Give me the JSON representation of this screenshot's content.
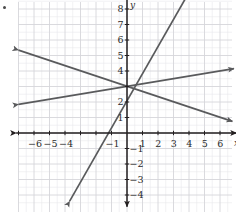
{
  "figure": {
    "marker": "•",
    "background_color": "#ffffff",
    "grid_color": "#d6d6da",
    "grid_minor_color": "#e9e9ec",
    "axis_color": "#231f20",
    "line_color": "#595a5c",
    "label_color": "#2b2b2b"
  },
  "axes": {
    "x_axis_letter": "x",
    "y_axis_letter": "y",
    "x_tick_labels": [
      "-6",
      "-5",
      "-4",
      "-1",
      "1",
      "2",
      "3",
      "4",
      "5",
      "6"
    ],
    "y_tick_labels": [
      "8",
      "7",
      "6",
      "5",
      "4",
      "2",
      "1",
      "-1",
      "-2",
      "-3",
      "-4"
    ]
  },
  "chart_data": {
    "type": "line",
    "title": "",
    "xlabel": "x",
    "ylabel": "y",
    "xlim": [
      -7.5,
      7.3
    ],
    "ylim": [
      -5.0,
      9.8
    ],
    "grid": true,
    "legend": "none",
    "x_ticks": [
      -6,
      -5,
      -4,
      -1,
      1,
      2,
      3,
      4,
      5,
      6
    ],
    "y_ticks": [
      8,
      7,
      6,
      5,
      4,
      2,
      1,
      -1,
      -2,
      -3,
      -4
    ],
    "x_ticks_all": [
      -7,
      -6,
      -5,
      -4,
      -3,
      -2,
      -1,
      0,
      1,
      2,
      3,
      4,
      5,
      6,
      7
    ],
    "y_ticks_all": [
      -4,
      -3,
      -2,
      -1,
      0,
      1,
      2,
      3,
      4,
      5,
      6,
      7,
      8,
      9
    ],
    "common_intersection": [
      0,
      3
    ],
    "series": [
      {
        "name": "steep-line",
        "slope": 2,
        "intercept": 3,
        "equation": "y = 2x + 3",
        "x_intercept": -1.5,
        "points": [
          [
            -3.7,
            -4.4
          ],
          [
            4.3,
            9.6
          ]
        ],
        "arrow_start": true,
        "arrow_end": true
      },
      {
        "name": "shallow-rising-line",
        "slope": 0.1667,
        "intercept": 3,
        "equation": "y = (1/6)x + 3",
        "x_intercept": -18,
        "points": [
          [
            -7.0,
            1.85
          ],
          [
            6.9,
            4.15
          ]
        ],
        "arrow_start": true,
        "arrow_end": true
      },
      {
        "name": "descending-line",
        "slope": -0.3333,
        "intercept": 3,
        "equation": "y = -(1/3)x + 3",
        "x_intercept": 9,
        "points": [
          [
            -7.0,
            5.35
          ],
          [
            6.8,
            0.75
          ]
        ],
        "arrow_start": true,
        "arrow_end": true
      }
    ]
  }
}
